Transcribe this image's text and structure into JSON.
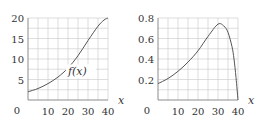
{
  "chart_data": [
    {
      "type": "line",
      "title": "",
      "curve_label": "f(x)",
      "xlabel": "x",
      "ylabel": "",
      "xlim": [
        0,
        40
      ],
      "ylim": [
        0,
        20
      ],
      "x_ticks": [
        "10",
        "20",
        "30",
        "40"
      ],
      "y_ticks": [
        "5",
        "10",
        "15",
        "20"
      ],
      "origin_label": "0",
      "grid": true,
      "grid_x_step": 5,
      "grid_y_step": 2.5,
      "x": [
        0,
        5,
        10,
        15,
        20,
        25,
        30,
        35,
        38,
        40
      ],
      "values": [
        2.0,
        2.8,
        4.0,
        5.6,
        7.8,
        10.8,
        14.5,
        18.0,
        19.5,
        20.0
      ]
    },
    {
      "type": "line",
      "title": "",
      "curve_label": "f'(x)",
      "xlabel": "x",
      "ylabel": "",
      "xlim": [
        0,
        40
      ],
      "ylim": [
        0,
        0.8
      ],
      "x_ticks": [
        "10",
        "20",
        "30",
        "40"
      ],
      "y_ticks": [
        "0.2",
        "0.4",
        "0.6",
        "0.8"
      ],
      "origin_label": "0",
      "grid": true,
      "grid_x_step": 5,
      "grid_y_step": 0.1,
      "x": [
        0,
        5,
        10,
        15,
        20,
        25,
        30,
        33,
        35,
        37,
        38,
        39,
        40
      ],
      "values": [
        0.16,
        0.21,
        0.28,
        0.37,
        0.48,
        0.62,
        0.74,
        0.72,
        0.66,
        0.52,
        0.4,
        0.22,
        0.0
      ]
    }
  ]
}
